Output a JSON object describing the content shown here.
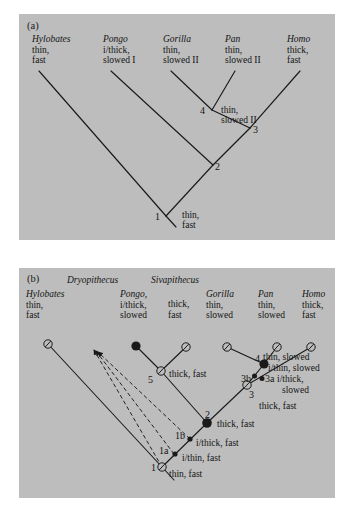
{
  "figure": {
    "background": "#ffffff",
    "panel_background": "#bdbdbd",
    "line_color": "#1a1a1a"
  },
  "panel_a": {
    "letter": "(a)",
    "tips": [
      {
        "taxon": "Hylobates",
        "line1": "thin,",
        "line2": "fast"
      },
      {
        "taxon": "Pongo",
        "line1": "i/thick,",
        "line2": "slowed I"
      },
      {
        "taxon": "Gorilla",
        "line1": "thin,",
        "line2": "slowed II"
      },
      {
        "taxon": "Pan",
        "line1": "thin,",
        "line2": "slowed II"
      },
      {
        "taxon": "Homo",
        "line1": "thick,",
        "line2": "fast"
      }
    ],
    "nodes": [
      {
        "id": "1",
        "label": "1"
      },
      {
        "id": "2",
        "label": "2"
      },
      {
        "id": "3",
        "label": "3"
      },
      {
        "id": "4",
        "label": "4"
      }
    ],
    "branch_states": [
      {
        "id": "node4-state",
        "line1": "thin,",
        "line2": "slowed II"
      },
      {
        "id": "node1-state",
        "line1": "thin,",
        "line2": "fast"
      }
    ]
  },
  "panel_b": {
    "letter": "(b)",
    "genus_headers": [
      {
        "name": "Dryopithecus"
      },
      {
        "name": "Sivapithecus"
      }
    ],
    "tips": [
      {
        "taxon": "Hylobates",
        "line1": "thin,",
        "line2": "fast",
        "marker": "open-slash-circle"
      },
      {
        "taxon": "Pongo,",
        "line1": "i/thick,",
        "line2": "slowed",
        "marker": "filled-circle"
      },
      {
        "taxon": "",
        "line1": "thick,",
        "line2": "fast",
        "marker": "open-slash-circle"
      },
      {
        "taxon": "Gorilla",
        "line1": "thin,",
        "line2": "slowed",
        "marker": "open-slash-circle"
      },
      {
        "taxon": "Pan",
        "line1": "thin,",
        "line2": "slowed",
        "marker": "open-slash-circle"
      },
      {
        "taxon": "Homo",
        "line1": "thick,",
        "line2": "fast",
        "marker": "open-slash-circle"
      }
    ],
    "nodes": [
      {
        "id": "1",
        "label": "1",
        "marker": "open-slash-circle"
      },
      {
        "id": "1a",
        "label": "1a",
        "marker": "small-filled-circle"
      },
      {
        "id": "1b",
        "label": "1b",
        "marker": "small-filled-circle"
      },
      {
        "id": "2",
        "label": "2",
        "marker": "filled-circle"
      },
      {
        "id": "3",
        "label": "3",
        "marker": "open-slash-circle"
      },
      {
        "id": "3a",
        "label": "3a",
        "marker": "small-filled-circle"
      },
      {
        "id": "3b",
        "label": "3b",
        "marker": "small-filled-circle"
      },
      {
        "id": "4",
        "label": "4",
        "marker": "filled-circle"
      },
      {
        "id": "5",
        "label": "5",
        "marker": "open-slash-circle"
      }
    ],
    "branch_states": [
      {
        "id": "state-node4",
        "text": "thin, slowed"
      },
      {
        "id": "state-node3b",
        "text": "i/thin, slowed"
      },
      {
        "id": "state-node3a-1",
        "text": "i/thick,"
      },
      {
        "id": "state-node3a-2",
        "text": "slowed"
      },
      {
        "id": "state-node3",
        "text": "thick, fast"
      },
      {
        "id": "state-node5",
        "text": "thick, fast"
      },
      {
        "id": "state-node2",
        "text": "thick, fast"
      },
      {
        "id": "state-node1b",
        "text": "i/thick, fast"
      },
      {
        "id": "state-node1a",
        "text": "i/thin, fast"
      },
      {
        "id": "state-node1",
        "text": "thin, fast"
      }
    ]
  }
}
